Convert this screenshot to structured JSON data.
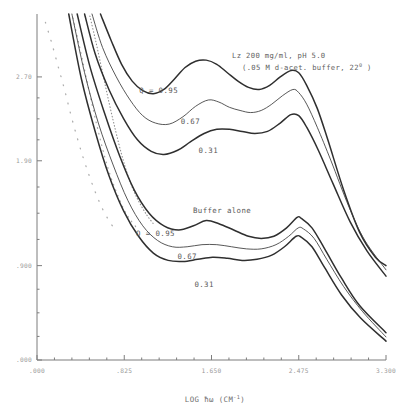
{
  "figure": {
    "header_line1": "Lz  200 mg/ml, pH 5.0",
    "header_line2_pre": "(.05 M d-acet. buffer, 22",
    "header_line2_sup": "0",
    "header_line2_post": " )",
    "group_label_buffer": "Buffer alone",
    "label_q_top": "Q = 0.95",
    "label_q_top_mid": "0.67",
    "label_q_top_low": "0.31",
    "label_q_bot": "Q = 0.95",
    "label_q_bot_mid": "0.67",
    "label_q_bot_low": "0.31"
  },
  "axis": {
    "xtitle_pre": "LOG ",
    "xtitle_sym": "ħω",
    "xtitle_unit_pre": " (CM",
    "xtitle_unit_sup": "-1",
    "xtitle_unit_post": ")"
  },
  "chart_data": {
    "type": "line",
    "xlabel": "LOG ħω (CM^-1)",
    "ylabel": "",
    "xlim": [
      0.0,
      3.3
    ],
    "ylim": [
      0.0,
      3.3
    ],
    "grid": false,
    "legend_position": "inline-annotations",
    "xticks": [
      ".000",
      ".825",
      "1.650",
      "2.475",
      "3.300"
    ],
    "xtick_values": [
      0.0,
      0.825,
      1.65,
      2.475,
      3.3
    ],
    "yticks": [
      "2.70",
      "1.90",
      ".900",
      ".000"
    ],
    "ytick_values": [
      2.7,
      1.9,
      0.9,
      0.0
    ],
    "annotations": [
      {
        "text": "Q = 0.95",
        "x": 1.15,
        "y": 2.55
      },
      {
        "text": "0.67",
        "x": 1.45,
        "y": 2.25
      },
      {
        "text": "0.31",
        "x": 1.62,
        "y": 1.97
      },
      {
        "text": "Buffer alone",
        "x": 1.75,
        "y": 1.4
      },
      {
        "text": "Q = 0.95",
        "x": 1.12,
        "y": 1.18
      },
      {
        "text": "0.67",
        "x": 1.42,
        "y": 0.96
      },
      {
        "text": "0.31",
        "x": 1.58,
        "y": 0.7
      }
    ],
    "series": [
      {
        "name": "Lz Q = 0.95",
        "group": "Lz 200 mg/ml",
        "q": 0.95,
        "style": "solid",
        "x": [
          0.6,
          0.7,
          0.8,
          0.9,
          1.0,
          1.1,
          1.2,
          1.3,
          1.4,
          1.5,
          1.6,
          1.7,
          1.8,
          1.9,
          2.0,
          2.1,
          2.2,
          2.3,
          2.4,
          2.475,
          2.55,
          2.65,
          2.75,
          2.9,
          3.05,
          3.2,
          3.3
        ],
        "y": [
          3.3,
          3.05,
          2.82,
          2.66,
          2.57,
          2.54,
          2.58,
          2.68,
          2.79,
          2.85,
          2.86,
          2.82,
          2.74,
          2.66,
          2.6,
          2.58,
          2.62,
          2.7,
          2.76,
          2.74,
          2.62,
          2.4,
          2.1,
          1.62,
          1.22,
          0.98,
          0.9
        ]
      },
      {
        "name": "Lz Q = 0.67",
        "group": "Lz 200 mg/ml",
        "q": 0.67,
        "style": "thin",
        "x": [
          0.52,
          0.62,
          0.75,
          0.88,
          1.0,
          1.12,
          1.25,
          1.38,
          1.5,
          1.62,
          1.72,
          1.82,
          1.92,
          2.02,
          2.12,
          2.22,
          2.32,
          2.42,
          2.475,
          2.55,
          2.65,
          2.78,
          2.95,
          3.1,
          3.3
        ],
        "y": [
          3.3,
          2.98,
          2.7,
          2.48,
          2.33,
          2.26,
          2.25,
          2.32,
          2.42,
          2.48,
          2.46,
          2.41,
          2.38,
          2.36,
          2.38,
          2.44,
          2.52,
          2.58,
          2.55,
          2.44,
          2.22,
          1.9,
          1.46,
          1.14,
          0.86
        ]
      },
      {
        "name": "Lz Q = 0.31",
        "group": "Lz 200 mg/ml",
        "q": 0.31,
        "style": "solid",
        "x": [
          0.45,
          0.55,
          0.68,
          0.82,
          0.95,
          1.08,
          1.2,
          1.33,
          1.45,
          1.58,
          1.7,
          1.82,
          1.94,
          2.06,
          2.18,
          2.3,
          2.4,
          2.475,
          2.55,
          2.66,
          2.8,
          2.96,
          3.12,
          3.3
        ],
        "y": [
          3.3,
          2.92,
          2.58,
          2.3,
          2.1,
          1.99,
          1.96,
          2.0,
          2.08,
          2.16,
          2.2,
          2.2,
          2.18,
          2.16,
          2.18,
          2.26,
          2.34,
          2.33,
          2.22,
          2.0,
          1.68,
          1.32,
          1.04,
          0.8
        ]
      },
      {
        "name": "Buffer Q = 0.95",
        "group": "Buffer alone",
        "q": 0.95,
        "style": "solid",
        "x": [
          0.38,
          0.5,
          0.64,
          0.78,
          0.92,
          1.06,
          1.2,
          1.34,
          1.48,
          1.6,
          1.72,
          1.86,
          2.0,
          2.12,
          2.24,
          2.36,
          2.46,
          2.5,
          2.6,
          2.72,
          2.88,
          3.05,
          3.3
        ],
        "y": [
          3.3,
          2.8,
          2.35,
          1.95,
          1.62,
          1.4,
          1.28,
          1.24,
          1.28,
          1.33,
          1.3,
          1.24,
          1.18,
          1.16,
          1.18,
          1.26,
          1.36,
          1.35,
          1.26,
          1.06,
          0.78,
          0.52,
          0.26
        ]
      },
      {
        "name": "Buffer Q = 0.67",
        "group": "Buffer alone",
        "q": 0.67,
        "style": "thin",
        "x": [
          0.33,
          0.45,
          0.58,
          0.72,
          0.86,
          1.0,
          1.14,
          1.28,
          1.42,
          1.56,
          1.7,
          1.84,
          1.98,
          2.12,
          2.26,
          2.38,
          2.47,
          2.52,
          2.62,
          2.74,
          2.9,
          3.08,
          3.3
        ],
        "y": [
          3.3,
          2.74,
          2.26,
          1.86,
          1.52,
          1.28,
          1.14,
          1.08,
          1.08,
          1.1,
          1.1,
          1.08,
          1.06,
          1.06,
          1.1,
          1.18,
          1.26,
          1.25,
          1.16,
          0.96,
          0.7,
          0.46,
          0.22
        ]
      },
      {
        "name": "Buffer Q = 0.31",
        "group": "Buffer alone",
        "q": 0.31,
        "style": "solid",
        "x": [
          0.3,
          0.42,
          0.55,
          0.68,
          0.82,
          0.96,
          1.1,
          1.24,
          1.38,
          1.52,
          1.66,
          1.8,
          1.94,
          2.08,
          2.22,
          2.34,
          2.45,
          2.5,
          2.6,
          2.72,
          2.88,
          3.06,
          3.3
        ],
        "y": [
          3.3,
          2.68,
          2.18,
          1.76,
          1.42,
          1.18,
          1.02,
          0.95,
          0.94,
          0.96,
          0.98,
          0.97,
          0.95,
          0.96,
          1.0,
          1.08,
          1.18,
          1.17,
          1.08,
          0.88,
          0.62,
          0.4,
          0.18
        ]
      }
    ],
    "dotted_low_q_branches": [
      {
        "name": "dotted branch A (sparse)",
        "x": [
          0.08,
          0.14,
          0.2,
          0.26,
          0.32,
          0.38,
          0.44,
          0.5,
          0.56,
          0.62,
          0.68,
          0.74
        ],
        "y": [
          3.22,
          3.02,
          2.8,
          2.58,
          2.34,
          2.12,
          1.92,
          1.74,
          1.58,
          1.44,
          1.33,
          1.24
        ]
      },
      {
        "name": "dotted branch B",
        "x": [
          0.34,
          0.4,
          0.46,
          0.52,
          0.58,
          0.64,
          0.7,
          0.76,
          0.82,
          0.88,
          0.96
        ],
        "y": [
          3.26,
          3.0,
          2.72,
          2.44,
          2.18,
          1.94,
          1.74,
          1.58,
          1.44,
          1.34,
          1.24
        ]
      },
      {
        "name": "dotted branch C",
        "x": [
          0.5,
          0.56,
          0.62,
          0.68,
          0.74,
          0.8,
          0.86,
          0.92,
          0.98,
          1.04,
          1.1
        ],
        "y": [
          3.28,
          3.02,
          2.74,
          2.46,
          2.2,
          1.96,
          1.76,
          1.6,
          1.48,
          1.38,
          1.3
        ]
      }
    ]
  }
}
